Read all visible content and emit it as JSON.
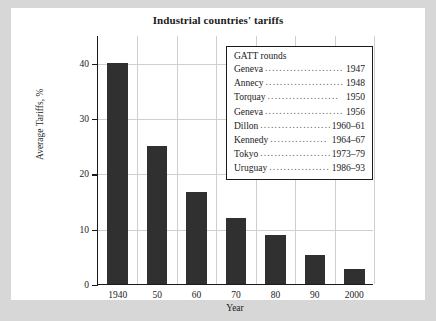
{
  "chart_data": {
    "type": "bar",
    "title": "Industrial countries' tariffs",
    "xlabel": "Year",
    "ylabel": "Average Tariffs, %",
    "categories": [
      "1940",
      "50",
      "60",
      "70",
      "80",
      "90",
      "2000"
    ],
    "values": [
      40,
      25,
      16.7,
      12,
      8.8,
      5.2,
      2.7
    ],
    "ylim": [
      0,
      45
    ],
    "yticks": [
      0,
      10,
      20,
      30,
      40
    ],
    "ytick_labels": [
      "0",
      "10",
      "20",
      "30",
      "40"
    ],
    "grid": "both-light",
    "legend_position": "inside-top-right",
    "bar_color": "#303030",
    "plot_background": "#ffffff",
    "page_background": "#d7d7d7",
    "annotations": {
      "legend_title": "GATT rounds",
      "legend_rounds": [
        {
          "round": "Geneva",
          "dots": "........................",
          "years": "1947"
        },
        {
          "round": "Annecy",
          "dots": "........................",
          "years": "1948"
        },
        {
          "round": "Torquay",
          "dots": "....................",
          "years": "1950"
        },
        {
          "round": "Geneva",
          "dots": "........................",
          "years": "1956"
        },
        {
          "round": "Dillon",
          "dots": "....................",
          "years": "1960–61"
        },
        {
          "round": "Kennedy",
          "dots": "................",
          "years": "1964–67"
        },
        {
          "round": "Tokyo",
          "dots": "....................",
          "years": "1973–79"
        },
        {
          "round": "Uruguay",
          "dots": "..................",
          "years": "1986–93"
        }
      ]
    }
  }
}
